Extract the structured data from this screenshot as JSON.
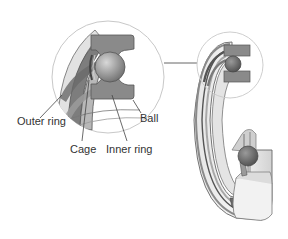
{
  "diagram": {
    "labels": {
      "outer_ring": "Outer ring",
      "cage": "Cage",
      "inner_ring": "Inner ring",
      "ball": "Ball"
    },
    "colors": {
      "ring_fill": "#8a8a8a",
      "ball_fill": "#9a9a9a",
      "ring_light": "#d9d9d9",
      "ring_lighter": "#ececec",
      "outline": "#555555",
      "circle_outline": "#c8c8c8",
      "leader_line": "#444444"
    }
  }
}
